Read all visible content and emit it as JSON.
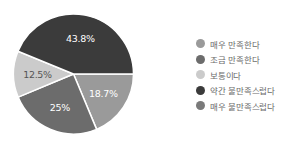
{
  "chart_data": {
    "type": "pie",
    "title": "",
    "start_angle": "3 o'clock, clockwise",
    "categories": [
      "매우 만족한다",
      "조금 만족한다",
      "보통이다",
      "약간 불만족스럽다",
      "매우 불만족스럽다"
    ],
    "values": [
      18.7,
      25,
      12.5,
      43.8,
      0
    ],
    "labels": [
      "18.7%",
      "25%",
      "12.5%",
      "43.8%",
      ""
    ],
    "colors": [
      "#9a9a9a",
      "#6c6c6c",
      "#cbcbcb",
      "#3b3b3b",
      "#7a7a7a"
    ],
    "label_colors": [
      "#ffffff",
      "#ffffff",
      "#555555",
      "#ffffff",
      "#ffffff"
    ],
    "legend_position": "right"
  },
  "legend": {
    "items": [
      {
        "label": "매우 만족한다",
        "color": "#9a9a9a"
      },
      {
        "label": "조금 만족한다",
        "color": "#6c6c6c"
      },
      {
        "label": "보통이다",
        "color": "#cbcbcb"
      },
      {
        "label": "약간 불만족스럽다",
        "color": "#3b3b3b"
      },
      {
        "label": "매우 불만족스럽다",
        "color": "#7a7a7a"
      }
    ]
  }
}
